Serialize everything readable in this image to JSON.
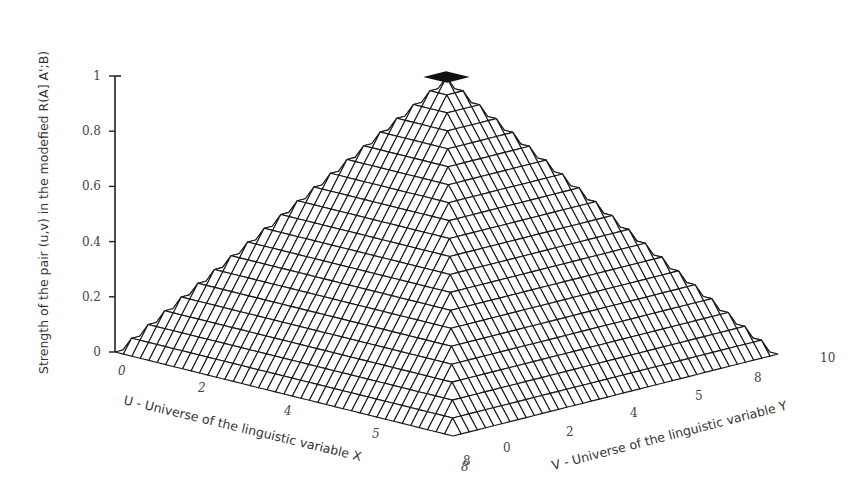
{
  "chart_data": {
    "type": "surface3d",
    "title": "",
    "zlabel": "Strength of the pair (u,v) in the modefied R(A] A';B)",
    "xlabel": "U - Universe of the linguistic variable X",
    "ylabel": "V - Universe of the linguistic variable Y",
    "z_ticks": [
      "0",
      "0.2",
      "0.4",
      "0.6",
      "0.8",
      "1"
    ],
    "z_tick_values": [
      0,
      0.2,
      0.4,
      0.6,
      0.8,
      1
    ],
    "x_ticks": [
      "0",
      "2",
      "4",
      "5",
      "8"
    ],
    "y_ticks": [
      "8",
      "0",
      "2",
      "4",
      "5",
      "8",
      "10"
    ],
    "zlim": [
      0,
      1
    ],
    "surface": {
      "shape": "pyramid",
      "u_range": [
        0,
        10
      ],
      "v_range": [
        0,
        10
      ],
      "peak_at": [
        5,
        5
      ],
      "peak_value": 1,
      "base_value": 0,
      "formula": "z = 1 - max(|u-5|, |v-5|)/5",
      "grid_resolution": 40
    },
    "grid": false,
    "legend": null
  },
  "colors": {
    "mesh_stroke": "#1a1a1a",
    "mesh_fill": "#ffffff",
    "axis": "#222222",
    "text": "#444444"
  }
}
